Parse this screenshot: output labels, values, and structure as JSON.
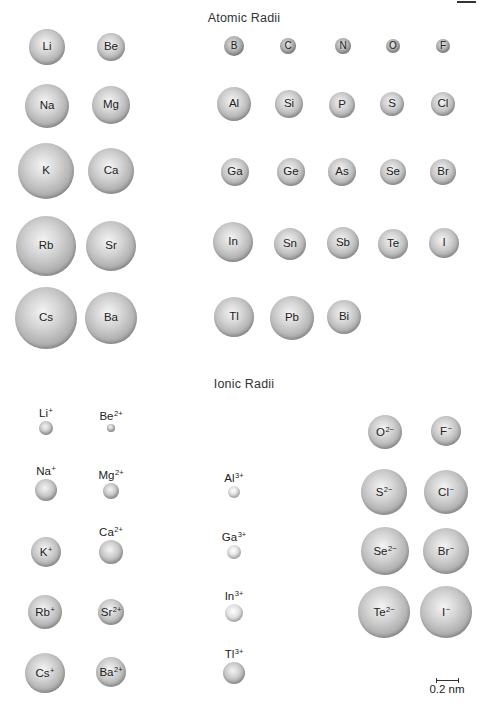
{
  "atomic": {
    "title": "Atomic Radii",
    "elements": [
      {
        "symbol": "Li",
        "x": 47,
        "y": 47,
        "r": 18
      },
      {
        "symbol": "Be",
        "x": 111,
        "y": 47,
        "r": 14
      },
      {
        "symbol": "Na",
        "x": 47,
        "y": 106,
        "r": 22
      },
      {
        "symbol": "Mg",
        "x": 111,
        "y": 105,
        "r": 19
      },
      {
        "symbol": "K",
        "x": 46,
        "y": 171,
        "r": 28
      },
      {
        "symbol": "Ca",
        "x": 111,
        "y": 171,
        "r": 23
      },
      {
        "symbol": "Rb",
        "x": 46,
        "y": 246,
        "r": 30
      },
      {
        "symbol": "Sr",
        "x": 111,
        "y": 246,
        "r": 25
      },
      {
        "symbol": "Cs",
        "x": 46,
        "y": 318,
        "r": 31
      },
      {
        "symbol": "Ba",
        "x": 111,
        "y": 318,
        "r": 26
      },
      {
        "symbol": "B",
        "x": 234,
        "y": 46,
        "r": 10
      },
      {
        "symbol": "C",
        "x": 288,
        "y": 46,
        "r": 8
      },
      {
        "symbol": "N",
        "x": 343,
        "y": 46,
        "r": 8
      },
      {
        "symbol": "O",
        "x": 393,
        "y": 46,
        "r": 7
      },
      {
        "symbol": "F",
        "x": 443,
        "y": 46,
        "r": 7
      },
      {
        "symbol": "Al",
        "x": 234,
        "y": 104,
        "r": 17
      },
      {
        "symbol": "Si",
        "x": 289,
        "y": 104,
        "r": 14
      },
      {
        "symbol": "P",
        "x": 342,
        "y": 105,
        "r": 13
      },
      {
        "symbol": "S",
        "x": 392,
        "y": 104,
        "r": 12
      },
      {
        "symbol": "Cl",
        "x": 443,
        "y": 104,
        "r": 12
      },
      {
        "symbol": "Ga",
        "x": 235,
        "y": 172,
        "r": 14
      },
      {
        "symbol": "Ge",
        "x": 291,
        "y": 172,
        "r": 14
      },
      {
        "symbol": "As",
        "x": 342,
        "y": 172,
        "r": 14
      },
      {
        "symbol": "Se",
        "x": 393,
        "y": 172,
        "r": 13
      },
      {
        "symbol": "Br",
        "x": 443,
        "y": 172,
        "r": 13
      },
      {
        "symbol": "In",
        "x": 233,
        "y": 242,
        "r": 20
      },
      {
        "symbol": "Sn",
        "x": 290,
        "y": 244,
        "r": 16
      },
      {
        "symbol": "Sb",
        "x": 343,
        "y": 243,
        "r": 16
      },
      {
        "symbol": "Te",
        "x": 393,
        "y": 244,
        "r": 15
      },
      {
        "symbol": "I",
        "x": 444,
        "y": 243,
        "r": 15
      },
      {
        "symbol": "Tl",
        "x": 234,
        "y": 317,
        "r": 20
      },
      {
        "symbol": "Pb",
        "x": 292,
        "y": 318,
        "r": 22
      },
      {
        "symbol": "Bi",
        "x": 344,
        "y": 317,
        "r": 17
      }
    ]
  },
  "ionic": {
    "title": "Ionic Radii",
    "ions": [
      {
        "symbol": "Li",
        "charge": "+",
        "x": 46,
        "y": 428,
        "r": 7,
        "label_pos": "above"
      },
      {
        "symbol": "Be",
        "charge": "2+",
        "x": 111,
        "y": 428,
        "r": 4,
        "label_pos": "above"
      },
      {
        "symbol": "Na",
        "charge": "+",
        "x": 46,
        "y": 490,
        "r": 11,
        "label_pos": "above"
      },
      {
        "symbol": "Mg",
        "charge": "2+",
        "x": 111,
        "y": 491,
        "r": 8,
        "label_pos": "above"
      },
      {
        "symbol": "Al",
        "charge": "3+",
        "x": 234,
        "y": 492,
        "r": 6,
        "label_pos": "above"
      },
      {
        "symbol": "K",
        "charge": "+",
        "x": 46,
        "y": 552,
        "r": 15,
        "label_pos": "inside"
      },
      {
        "symbol": "Ca",
        "charge": "2+",
        "x": 111,
        "y": 552,
        "r": 12,
        "label_pos": "above"
      },
      {
        "symbol": "Ga",
        "charge": "3+",
        "x": 234,
        "y": 552,
        "r": 7,
        "label_pos": "above"
      },
      {
        "symbol": "Rb",
        "charge": "+",
        "x": 45,
        "y": 612,
        "r": 17,
        "label_pos": "inside"
      },
      {
        "symbol": "Sr",
        "charge": "2+",
        "x": 111,
        "y": 612,
        "r": 13,
        "label_pos": "inside"
      },
      {
        "symbol": "In",
        "charge": "3+",
        "x": 234,
        "y": 613,
        "r": 9,
        "label_pos": "above"
      },
      {
        "symbol": "Cs",
        "charge": "+",
        "x": 45,
        "y": 673,
        "r": 20,
        "label_pos": "inside"
      },
      {
        "symbol": "Ba",
        "charge": "2+",
        "x": 111,
        "y": 672,
        "r": 15,
        "label_pos": "inside"
      },
      {
        "symbol": "Tl",
        "charge": "3+",
        "x": 234,
        "y": 673,
        "r": 11,
        "label_pos": "above"
      },
      {
        "symbol": "O",
        "charge": "2−",
        "x": 385,
        "y": 432,
        "r": 17,
        "label_pos": "inside"
      },
      {
        "symbol": "F",
        "charge": "−",
        "x": 446,
        "y": 431,
        "r": 15,
        "label_pos": "inside"
      },
      {
        "symbol": "S",
        "charge": "2−",
        "x": 384,
        "y": 492,
        "r": 23,
        "label_pos": "inside"
      },
      {
        "symbol": "Cl",
        "charge": "−",
        "x": 446,
        "y": 492,
        "r": 22,
        "label_pos": "inside"
      },
      {
        "symbol": "Se",
        "charge": "2−",
        "x": 385,
        "y": 551,
        "r": 24,
        "label_pos": "inside"
      },
      {
        "symbol": "Br",
        "charge": "−",
        "x": 446,
        "y": 551,
        "r": 23,
        "label_pos": "inside"
      },
      {
        "symbol": "Te",
        "charge": "2−",
        "x": 384,
        "y": 612,
        "r": 26,
        "label_pos": "inside"
      },
      {
        "symbol": "I",
        "charge": "−",
        "x": 446,
        "y": 612,
        "r": 26,
        "label_pos": "inside"
      }
    ]
  },
  "scale": {
    "label": "0.2 nm"
  }
}
